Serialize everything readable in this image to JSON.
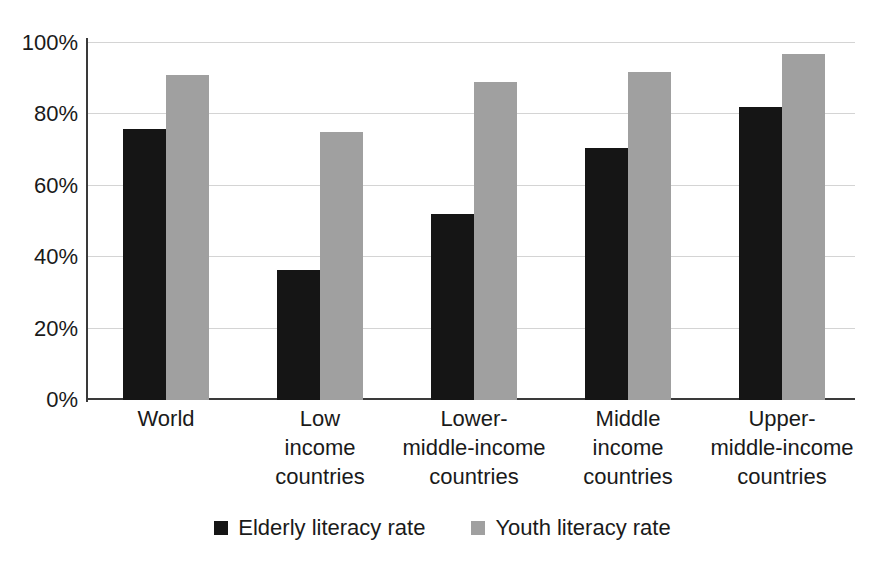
{
  "chart_data": {
    "type": "bar",
    "title": "",
    "subtitle": "",
    "xlabel": "",
    "ylabel": "",
    "ylim": [
      0,
      100
    ],
    "y_unit": "%",
    "grid": true,
    "legend_position": "bottom",
    "y_ticks": [
      "0%",
      "20%",
      "40%",
      "60%",
      "80%",
      "100%"
    ],
    "y_tick_values": [
      0,
      20,
      40,
      60,
      80,
      100
    ],
    "categories": [
      "World",
      "Low income countries",
      "Lower-middle-income countries",
      "Middle income countries",
      "Upper-middle-income countries"
    ],
    "category_label_lines": [
      [
        "World"
      ],
      [
        "Low",
        "income",
        "countries"
      ],
      [
        "Lower-",
        "middle-income",
        "countries"
      ],
      [
        "Middle",
        "income",
        "countries"
      ],
      [
        "Upper-",
        "middle-income",
        "countries"
      ]
    ],
    "series": [
      {
        "name": "Elderly literacy rate",
        "color": "#151515",
        "values": [
          76,
          36.5,
          52,
          70.5,
          82
        ]
      },
      {
        "name": "Youth literacy rate",
        "color": "#a0a0a0",
        "values": [
          91,
          75,
          89,
          92,
          97
        ]
      }
    ]
  },
  "legend": {
    "items": [
      {
        "label": "Elderly literacy rate",
        "color": "#151515"
      },
      {
        "label": "Youth literacy rate",
        "color": "#a0a0a0"
      }
    ]
  },
  "colors": {
    "elderly": "#151515",
    "youth": "#a0a0a0",
    "gridline": "#d4d4d4",
    "axis": "#3a3a3a",
    "background": "#ffffff",
    "text": "#1a1a1a"
  }
}
